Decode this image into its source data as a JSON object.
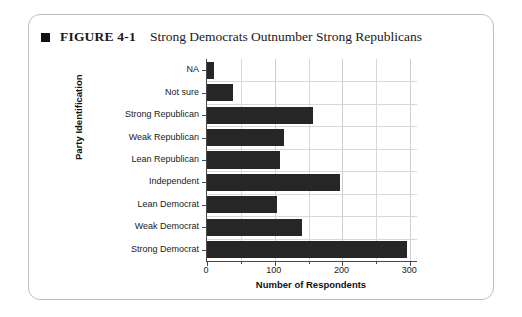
{
  "figure": {
    "bullet_icon": "black-square-icon",
    "number": "FIGURE 4-1",
    "title": "Strong Democrats Outnumber Strong Republicans"
  },
  "chart_data": {
    "type": "bar",
    "orientation": "horizontal",
    "title": "Strong Democrats Outnumber Strong Republicans",
    "xlabel": "Number of Respondents",
    "ylabel": "Party Identification",
    "categories": [
      "NA",
      "Not sure",
      "Strong Republican",
      "Weak Republican",
      "Lean Republican",
      "Independent",
      "Lean Democrat",
      "Weak Democrat",
      "Strong Democrat"
    ],
    "values": [
      10,
      38,
      157,
      113,
      108,
      197,
      104,
      140,
      295
    ],
    "xlim": [
      0,
      310
    ],
    "xticks": [
      0,
      100,
      200,
      300
    ],
    "xtick_labels": [
      "0",
      "100",
      "200",
      "300"
    ],
    "xminor_ticks": [
      50,
      150,
      250
    ],
    "grid": true,
    "legend": false,
    "bar_color": "#262626",
    "plot_background": "#ffffff",
    "grid_color": "#d8d8d8",
    "axis_color": "#4a4a4a"
  }
}
